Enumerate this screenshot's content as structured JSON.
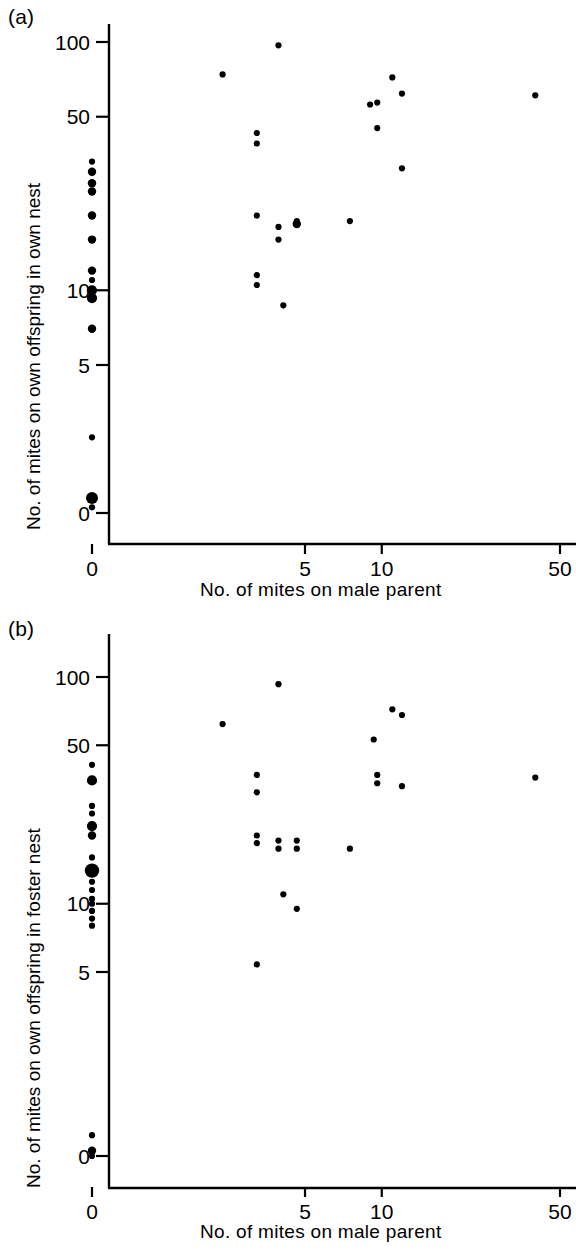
{
  "figure": {
    "background": "#ffffff",
    "ink": "#000000",
    "width": 576,
    "height": 1250
  },
  "panels": [
    {
      "id": "a",
      "label": "(a)",
      "xlabel": "No. of mites on male parent",
      "ylabel": "No. of mites on own offspring in own nest"
    },
    {
      "id": "b",
      "label": "(b)",
      "xlabel": "No. of mites on male parent",
      "ylabel": "No. of mites on own offspring in foster nest"
    }
  ],
  "chart_data": [
    {
      "type": "scatter",
      "panel": "(a)",
      "title": "",
      "xlabel": "No. of mites on male parent",
      "ylabel": "No. of mites on own offspring in own nest",
      "xscale": "log-like (0 offset, then log)",
      "yscale": "log-like (0 offset, then log)",
      "xticks": [
        0,
        5,
        10,
        50
      ],
      "yticks": [
        0,
        5,
        10,
        50,
        100
      ],
      "xlim": [
        0,
        50
      ],
      "ylim": [
        0,
        130
      ],
      "grid": false,
      "legend": null,
      "marker_color": "#000000",
      "marker_note": "Filled circles; larger circles indicate multiple overlapping observations",
      "points": [
        {
          "x": 0,
          "y": 33,
          "n": 1
        },
        {
          "x": 0,
          "y": 30,
          "n": 2
        },
        {
          "x": 0,
          "y": 27,
          "n": 2
        },
        {
          "x": 0,
          "y": 25,
          "n": 2
        },
        {
          "x": 0,
          "y": 20,
          "n": 2
        },
        {
          "x": 0,
          "y": 16,
          "n": 2
        },
        {
          "x": 0,
          "y": 12,
          "n": 2
        },
        {
          "x": 0,
          "y": 11,
          "n": 1
        },
        {
          "x": 0,
          "y": 10,
          "n": 3
        },
        {
          "x": 0,
          "y": 9.3,
          "n": 3
        },
        {
          "x": 0,
          "y": 7,
          "n": 2
        },
        {
          "x": 0,
          "y": 4.6,
          "n": 1
        },
        {
          "x": 0,
          "y": 4.0,
          "n": 4
        },
        {
          "x": 0,
          "y": 1.4,
          "n": 1
        },
        {
          "x": 2,
          "y": 74,
          "n": 1
        },
        {
          "x": 3,
          "y": 43,
          "n": 1
        },
        {
          "x": 3,
          "y": 39,
          "n": 1
        },
        {
          "x": 3,
          "y": 20,
          "n": 1
        },
        {
          "x": 3,
          "y": 11.5,
          "n": 1
        },
        {
          "x": 3,
          "y": 10.5,
          "n": 1
        },
        {
          "x": 3.8,
          "y": 97,
          "n": 1
        },
        {
          "x": 3.8,
          "y": 18,
          "n": 1
        },
        {
          "x": 3.8,
          "y": 16,
          "n": 1
        },
        {
          "x": 4,
          "y": 8.7,
          "n": 1
        },
        {
          "x": 4.6,
          "y": 19,
          "n": 1
        },
        {
          "x": 4.6,
          "y": 18.5,
          "n": 2
        },
        {
          "x": 7.5,
          "y": 19,
          "n": 1
        },
        {
          "x": 9,
          "y": 56,
          "n": 1
        },
        {
          "x": 9.6,
          "y": 57,
          "n": 1
        },
        {
          "x": 9.6,
          "y": 45,
          "n": 1
        },
        {
          "x": 11,
          "y": 72,
          "n": 1
        },
        {
          "x": 12,
          "y": 62,
          "n": 1
        },
        {
          "x": 12,
          "y": 31,
          "n": 1
        },
        {
          "x": 40,
          "y": 61,
          "n": 1
        }
      ]
    },
    {
      "type": "scatter",
      "panel": "(b)",
      "title": "",
      "xlabel": "No. of mites on male parent",
      "ylabel": "No. of mites on own offspring in foster nest",
      "xscale": "log-like (0 offset, then log)",
      "yscale": "log-like (0 offset, then log)",
      "xticks": [
        0,
        5,
        10,
        50
      ],
      "yticks": [
        0,
        5,
        10,
        50,
        100
      ],
      "xlim": [
        0,
        50
      ],
      "ylim": [
        0,
        130
      ],
      "grid": false,
      "legend": null,
      "marker_color": "#000000",
      "marker_note": "Filled circles; larger circles indicate multiple overlapping observations",
      "points": [
        {
          "x": 0,
          "y": 41,
          "n": 1
        },
        {
          "x": 0,
          "y": 35,
          "n": 3
        },
        {
          "x": 0,
          "y": 27,
          "n": 1
        },
        {
          "x": 0,
          "y": 25,
          "n": 1
        },
        {
          "x": 0,
          "y": 22,
          "n": 3
        },
        {
          "x": 0,
          "y": 20,
          "n": 2
        },
        {
          "x": 0,
          "y": 16,
          "n": 1
        },
        {
          "x": 0,
          "y": 14,
          "n": 5
        },
        {
          "x": 0,
          "y": 12.5,
          "n": 1
        },
        {
          "x": 0,
          "y": 11.5,
          "n": 1
        },
        {
          "x": 0,
          "y": 10.5,
          "n": 1
        },
        {
          "x": 0,
          "y": 10,
          "n": 1
        },
        {
          "x": 0,
          "y": 9.3,
          "n": 1
        },
        {
          "x": 0,
          "y": 8.6,
          "n": 1
        },
        {
          "x": 0,
          "y": 8.0,
          "n": 1
        },
        {
          "x": 0,
          "y": 4.7,
          "n": 2
        },
        {
          "x": 0,
          "y": 3.9,
          "n": 1
        },
        {
          "x": 0,
          "y": 0,
          "n": 1
        },
        {
          "x": 2,
          "y": 62,
          "n": 1
        },
        {
          "x": 3,
          "y": 37,
          "n": 1
        },
        {
          "x": 3,
          "y": 31,
          "n": 1
        },
        {
          "x": 3,
          "y": 20,
          "n": 1
        },
        {
          "x": 3,
          "y": 18.5,
          "n": 1
        },
        {
          "x": 3,
          "y": 5.4,
          "n": 1
        },
        {
          "x": 3.8,
          "y": 93,
          "n": 1
        },
        {
          "x": 3.8,
          "y": 19,
          "n": 1
        },
        {
          "x": 3.8,
          "y": 17.5,
          "n": 1
        },
        {
          "x": 4,
          "y": 11,
          "n": 1
        },
        {
          "x": 4.6,
          "y": 19,
          "n": 1
        },
        {
          "x": 4.6,
          "y": 17.5,
          "n": 1
        },
        {
          "x": 4.6,
          "y": 9.5,
          "n": 1
        },
        {
          "x": 7.5,
          "y": 17.5,
          "n": 1
        },
        {
          "x": 9.3,
          "y": 53,
          "n": 1
        },
        {
          "x": 9.6,
          "y": 37,
          "n": 1
        },
        {
          "x": 9.6,
          "y": 34,
          "n": 1
        },
        {
          "x": 11,
          "y": 72,
          "n": 1
        },
        {
          "x": 12,
          "y": 68,
          "n": 1
        },
        {
          "x": 12,
          "y": 33,
          "n": 1
        },
        {
          "x": 40,
          "y": 36,
          "n": 1
        }
      ]
    }
  ]
}
